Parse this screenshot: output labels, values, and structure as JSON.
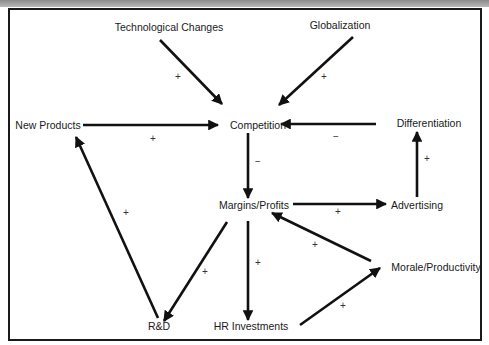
{
  "diagram": {
    "type": "causal-loop-diagram",
    "colors": {
      "line": "#111111",
      "text": "#1a1a1a",
      "background": "#ffffff",
      "frame": "#1a1a1a"
    },
    "nodes": {
      "technological_changes": "Technological Changes",
      "globalization": "Globalization",
      "new_products": "New Products",
      "competition": "Competition",
      "differentiation": "Differentiation",
      "margins_profits": "Margins/Profits",
      "advertising": "Advertising",
      "morale_productivity": "Morale/Productivity",
      "rd": "R&D",
      "hr_investments": "HR Investments"
    },
    "edges": [
      {
        "from": "Technological Changes",
        "to": "Competition",
        "sign": "+"
      },
      {
        "from": "Globalization",
        "to": "Competition",
        "sign": "+"
      },
      {
        "from": "New Products",
        "to": "Competition",
        "sign": "+"
      },
      {
        "from": "Differentiation",
        "to": "Competition",
        "sign": "−"
      },
      {
        "from": "Competition",
        "to": "Margins/Profits",
        "sign": "−"
      },
      {
        "from": "Margins/Profits",
        "to": "Advertising",
        "sign": "+"
      },
      {
        "from": "Advertising",
        "to": "Differentiation",
        "sign": "+"
      },
      {
        "from": "Margins/Profits",
        "to": "R&D",
        "sign": "+"
      },
      {
        "from": "R&D",
        "to": "New Products",
        "sign": "+"
      },
      {
        "from": "Margins/Profits",
        "to": "HR Investments",
        "sign": "+"
      },
      {
        "from": "HR Investments",
        "to": "Morale/Productivity",
        "sign": "+"
      },
      {
        "from": "Morale/Productivity",
        "to": "Margins/Profits",
        "sign": "+"
      }
    ],
    "signs": {
      "tech_comp": "+",
      "glob_comp": "+",
      "np_comp": "+",
      "diff_comp": "−",
      "comp_mp": "−",
      "mp_adv": "+",
      "adv_diff": "+",
      "mp_rd": "+",
      "rd_np": "+",
      "mp_hr": "+",
      "hr_mor": "+",
      "mor_mp": "+"
    }
  }
}
